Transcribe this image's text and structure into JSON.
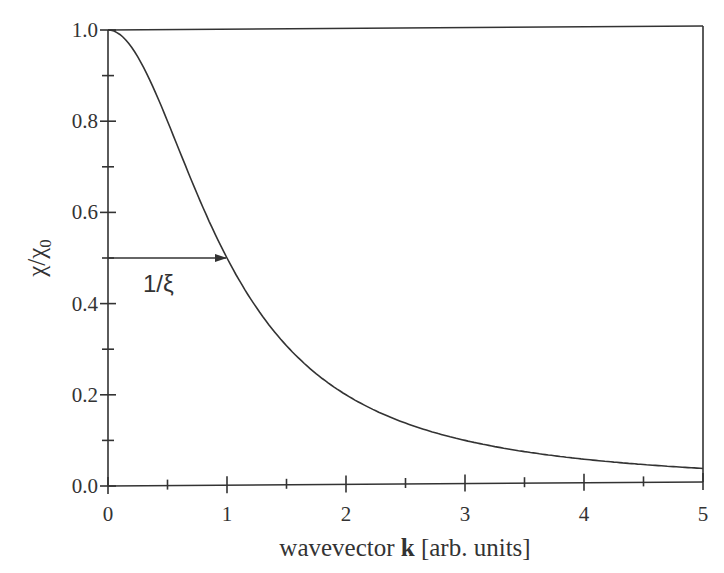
{
  "chart_data": {
    "type": "line",
    "title": "",
    "xlabel": "wavevector k [arb. units]",
    "xlabel_parts": {
      "prefix": "wavevector ",
      "bold": "k",
      "suffix": " [arb. units]"
    },
    "ylabel": "χ/χ0",
    "ylabel_parts": {
      "main": "χ/χ",
      "sub": "0"
    },
    "xlim": [
      0,
      5
    ],
    "ylim": [
      0,
      1.0
    ],
    "xticks": [
      0,
      1,
      2,
      3,
      4,
      5
    ],
    "xtick_labels": [
      "0",
      "1",
      "2",
      "3",
      "4",
      "5"
    ],
    "xminor_ticks": [
      0.5,
      1.5,
      2.5,
      3.5,
      4.5
    ],
    "yticks": [
      0.0,
      0.2,
      0.4,
      0.6,
      0.8,
      1.0
    ],
    "ytick_labels": [
      "0.0",
      "0.2",
      "0.4",
      "0.6",
      "0.8",
      "1.0"
    ],
    "yminor_ticks": [
      0.1,
      0.3,
      0.5,
      0.7,
      0.9
    ],
    "grid": false,
    "legend": null,
    "series": [
      {
        "name": "χ/χ0 = 1/(1+(kξ)²)",
        "color": "#333333",
        "x": [
          0,
          0.25,
          0.5,
          0.75,
          1.0,
          1.25,
          1.5,
          1.75,
          2.0,
          2.5,
          3.0,
          3.5,
          4.0,
          4.5,
          5.0
        ],
        "y": [
          1.0,
          0.941,
          0.8,
          0.64,
          0.5,
          0.39,
          0.308,
          0.246,
          0.2,
          0.138,
          0.1,
          0.075,
          0.059,
          0.047,
          0.038
        ]
      }
    ],
    "annotations": [
      {
        "type": "arrow",
        "from": [
          0,
          0.5
        ],
        "to": [
          1,
          0.5
        ],
        "label": "1/ξ",
        "label_pos": [
          0.4,
          0.43
        ]
      }
    ]
  },
  "annotation_label": "1/ξ"
}
